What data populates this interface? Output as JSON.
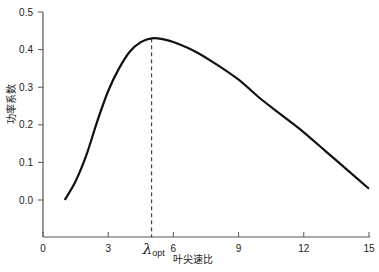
{
  "chart_data": {
    "type": "line",
    "title": "",
    "xlabel": "叶尖速比",
    "ylabel": "功率系数",
    "xlim": [
      0,
      15
    ],
    "ylim": [
      -0.1,
      0.5
    ],
    "grid": false,
    "x_ticks": [
      "0",
      "3",
      "λopt",
      "6",
      "9",
      "12",
      "15"
    ],
    "x_tick_values": [
      0,
      3,
      5,
      6,
      9,
      12,
      15
    ],
    "y_ticks": [
      "0.0",
      "0.1",
      "0.2",
      "0.3",
      "0.4",
      "0.5"
    ],
    "y_tick_values": [
      0.0,
      0.1,
      0.2,
      0.3,
      0.4,
      0.5
    ],
    "annotations": [
      {
        "type": "vline",
        "x": 5,
        "style": "dashed",
        "label": "λopt"
      }
    ],
    "series": [
      {
        "name": "Cp",
        "x": [
          1,
          1.5,
          2,
          2.5,
          3,
          3.5,
          4,
          4.5,
          5,
          5.5,
          6,
          7,
          8,
          9,
          10,
          11,
          12,
          13,
          14,
          15
        ],
        "values": [
          0.0,
          0.05,
          0.12,
          0.21,
          0.29,
          0.35,
          0.395,
          0.42,
          0.43,
          0.428,
          0.42,
          0.395,
          0.36,
          0.32,
          0.27,
          0.225,
          0.18,
          0.13,
          0.08,
          0.03
        ]
      }
    ]
  },
  "labels": {
    "xlabel": "叶尖速比",
    "ylabel": "功率系数",
    "lambda": "λ",
    "opt": "opt"
  }
}
